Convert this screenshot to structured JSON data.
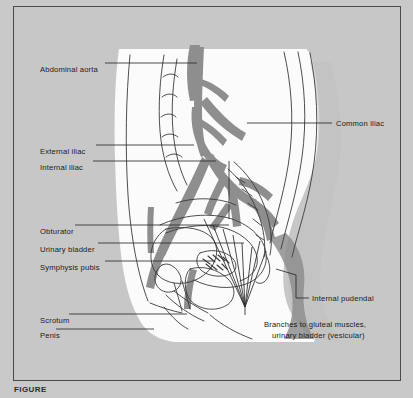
{
  "figure": {
    "caption": "FIGURE"
  },
  "colors": {
    "page_background": "#c9c9c9",
    "plate_background": "#c7c7c7",
    "body_silhouette": "#fbfbfb",
    "artery": "#8e8e8e",
    "outline": "#3a3a3a",
    "leader_line": "#2a2a2a",
    "frame_border": "#4a4a4a",
    "text": "#1a1a1a"
  },
  "labels_left": [
    {
      "id": "abdominal-aorta",
      "text": "Abdominal aorta",
      "x": 26,
      "y": 58,
      "line_x1": 104,
      "line_x2": 196,
      "line_y": 62
    },
    {
      "id": "external-iliac",
      "text": "External iliac",
      "x": 26,
      "y": 140,
      "line_x1": 95,
      "line_x2": 193,
      "line_y": 144
    },
    {
      "id": "internal-iliac",
      "text": "Internal iliac",
      "x": 26,
      "y": 156,
      "line_x1": 92,
      "line_x2": 215,
      "line_y": 160
    },
    {
      "id": "obturator",
      "text": "Obturator",
      "x": 26,
      "y": 220,
      "line_x1": 74,
      "line_x2": 228,
      "line_y": 224
    },
    {
      "id": "urinary-bladder",
      "text": "Urinary bladder",
      "x": 26,
      "y": 238,
      "line_x1": 97,
      "line_x2": 243,
      "line_y": 242
    },
    {
      "id": "symphysis-pubis",
      "text": "Symphysis pubis",
      "x": 26,
      "y": 256,
      "line_x1": 104,
      "line_x2": 214,
      "line_y": 260
    },
    {
      "id": "scrotum",
      "text": "Scrotum",
      "x": 26,
      "y": 309,
      "line_x1": 68,
      "line_x2": 186,
      "line_y": 313
    },
    {
      "id": "penis",
      "text": "Penis",
      "x": 26,
      "y": 324,
      "line_x1": 55,
      "line_x2": 153,
      "line_y": 328
    }
  ],
  "labels_right": [
    {
      "id": "common-iliac",
      "text": "Common iliac",
      "x": 336,
      "y": 118,
      "line_x1": 246,
      "line_x2": 331,
      "line_y": 122
    },
    {
      "id": "internal-pudendal",
      "text": "Internal pudendal",
      "x": 312,
      "y": 293,
      "line_x1": 295,
      "line_x2": 308,
      "line_y": 297
    }
  ],
  "labels_block": [
    {
      "id": "gluteal-branches-line1",
      "text": "Branches to gluteal muscles,",
      "x": 264,
      "y": 319
    },
    {
      "id": "gluteal-branches-line2",
      "text": "urinary bladder (vesicular)",
      "x": 272,
      "y": 330
    }
  ],
  "structures": [
    "abdominal aorta",
    "common iliac artery",
    "external iliac artery",
    "internal iliac artery",
    "obturator artery",
    "internal pudendal artery",
    "gluteal branches",
    "vesicular branches",
    "urinary bladder",
    "symphysis pubis",
    "scrotum",
    "penis",
    "sacrum",
    "lumbar vertebrae"
  ]
}
